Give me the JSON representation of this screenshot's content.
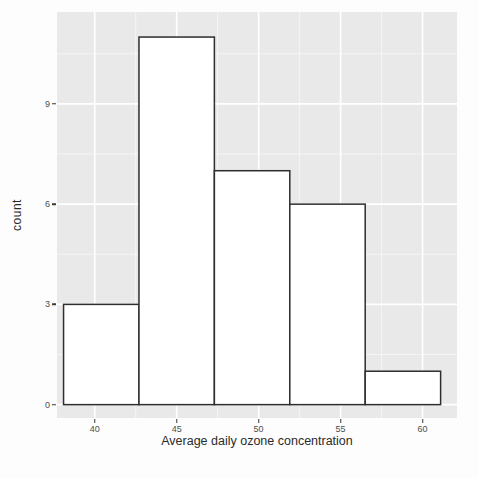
{
  "chart_data": {
    "type": "bar",
    "subtype": "histogram",
    "title": "",
    "xlabel": "Average daily ozone concentration",
    "ylabel": "count",
    "bin_edges": [
      38.1,
      42.7,
      47.3,
      51.9,
      56.5,
      61.1
    ],
    "counts": [
      3,
      11,
      7,
      6,
      1
    ],
    "x_ticks": [
      40,
      45,
      50,
      55,
      60
    ],
    "y_ticks": [
      0,
      3,
      6,
      9
    ],
    "x_minor_ticks": [
      42.5,
      47.5,
      52.5,
      57.5
    ],
    "y_minor_ticks": [
      1.5,
      4.5,
      7.5,
      10.5
    ],
    "xlim": [
      37.7,
      62.1
    ],
    "ylim": [
      -0.4,
      11.75
    ],
    "legend": "none",
    "grid": "major-and-minor",
    "panel_bg": "#e9e9e9",
    "major_grid_color": "#ffffff",
    "minor_grid_color": "rgba(255,255,255,0.55)",
    "bar_fill": "#ffffff",
    "bar_stroke": "#2e2e2e",
    "tick_color": "#3a3a3a",
    "tick_label_color": "#4d4d4d",
    "axis_title_color": "#2b2b2b"
  }
}
